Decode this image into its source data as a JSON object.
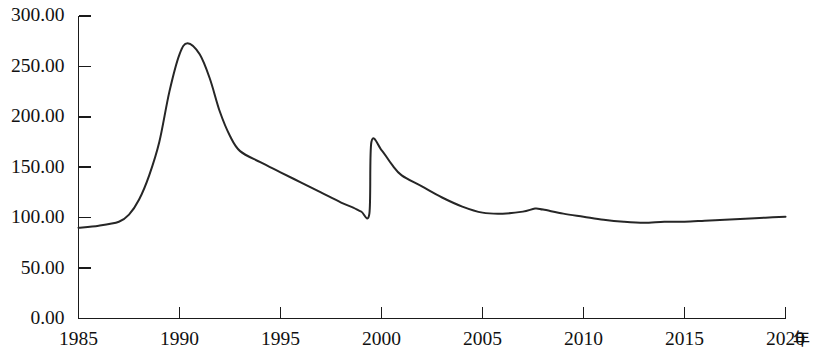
{
  "chart_data": {
    "type": "line",
    "title": "",
    "xlabel": "年",
    "ylabel": "",
    "xlim": [
      1985,
      2020
    ],
    "ylim": [
      0,
      300
    ],
    "grid": false,
    "legend": null,
    "x_tick_labels": [
      "1985",
      "1990",
      "1995",
      "2000",
      "2005",
      "2010",
      "2015",
      "2020"
    ],
    "x_ticks": [
      1985,
      1990,
      1995,
      2000,
      2005,
      2010,
      2015,
      2020
    ],
    "y_tick_labels": [
      "0.00",
      "50.00",
      "100.00",
      "150.00",
      "200.00",
      "250.00",
      "300.00"
    ],
    "y_ticks": [
      0,
      50,
      100,
      150,
      200,
      250,
      300
    ],
    "series": [
      {
        "name": "index",
        "color": "#262626",
        "x": [
          1985,
          1986,
          1987,
          1987.5,
          1988,
          1988.5,
          1989,
          1989.5,
          1990,
          1990.4,
          1991,
          1991.5,
          1992,
          1992.5,
          1993,
          1994,
          1995,
          1996,
          1997,
          1998,
          1998.6,
          1999.0,
          1999.4,
          1999.5,
          2000,
          2000.5,
          2001,
          2002,
          2003,
          2004,
          2005,
          2006,
          2007,
          2007.6,
          2008,
          2009,
          2010,
          2011,
          2012,
          2013,
          2014,
          2015,
          2016,
          2017,
          2018,
          2019,
          2020
        ],
        "values": [
          90,
          92,
          96,
          103,
          118,
          142,
          175,
          225,
          262,
          273,
          262,
          238,
          205,
          181,
          166,
          155,
          145,
          135,
          125,
          115,
          110,
          106,
          104,
          175,
          167,
          153,
          142,
          131,
          120,
          111,
          105,
          104,
          106,
          109,
          108,
          104,
          101,
          98,
          96,
          95,
          96,
          96,
          97,
          98,
          99,
          100,
          101
        ]
      }
    ],
    "annotations": []
  },
  "axis": {
    "unit_suffix": "年"
  }
}
